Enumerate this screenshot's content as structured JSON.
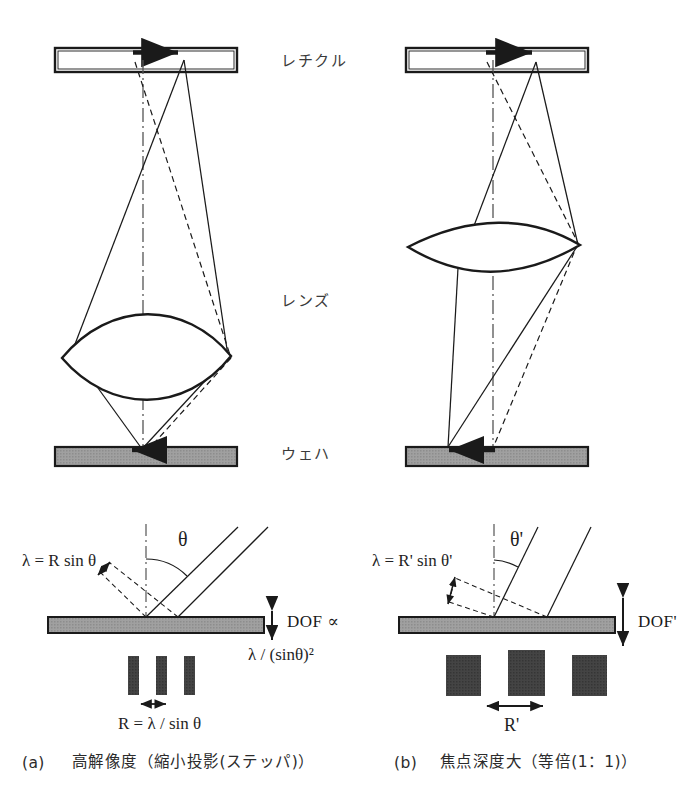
{
  "figure": {
    "title_visible": false,
    "background_color": "#ffffff",
    "ink_color": "#1a1a1a",
    "wafer_fill": "#9a9a9a",
    "bar_fill": "#3f3f3f"
  },
  "panels": [
    {
      "id": "a",
      "caption_index": "(a)",
      "caption_text": "高解像度（縮小投影(ステッパ)）",
      "component_labels": {
        "reticle": "レチクル",
        "lens": "レンズ",
        "wafer": "ウェハ"
      },
      "formulas": {
        "wavelength_relation": "λ = R sin θ",
        "angle_symbol": "θ",
        "dof_label": "DOF ∝",
        "dof_expression": "λ / (sinθ)²",
        "resolution": "R = λ / sin θ"
      },
      "geometry_notes": {
        "numerical_aperture_angle_deg": 50,
        "lens_type": "thick-biconvex",
        "magnification": "reduction",
        "pattern_bar_count": 3,
        "pattern_bar_width_px": 11,
        "pattern_pitch_px": 28
      }
    },
    {
      "id": "b",
      "caption_index": "(b)",
      "caption_text": "焦点深度大（等倍(1：1)）",
      "component_labels": {
        "reticle": "",
        "lens": "",
        "wafer": ""
      },
      "formulas": {
        "wavelength_relation": "λ = R' sin θ'",
        "angle_symbol": "θ'",
        "dof_label": "DOF'",
        "dof_expression": "",
        "resolution": "R'"
      },
      "geometry_notes": {
        "numerical_aperture_angle_deg": 25,
        "lens_type": "thin-biconvex",
        "magnification": "1:1",
        "pattern_bar_count": 3,
        "pattern_bar_width_px": 35,
        "pattern_pitch_px": 62
      }
    }
  ],
  "shared_labels": {
    "reticle": "レチクル",
    "lens": "レンズ",
    "wafer": "ウェハ"
  }
}
